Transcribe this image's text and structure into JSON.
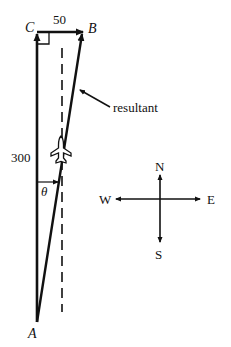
{
  "diagram": {
    "points": {
      "A": {
        "label": "A"
      },
      "B": {
        "label": "B"
      },
      "C": {
        "label": "C"
      }
    },
    "vectors": {
      "north": {
        "label": "300"
      },
      "east": {
        "label": "50"
      },
      "resultant": {
        "label": "resultant"
      }
    },
    "angle": {
      "label": "θ"
    },
    "compass": {
      "N": "N",
      "S": "S",
      "E": "E",
      "W": "W"
    },
    "colors": {
      "stroke": "#111111",
      "background": "#ffffff"
    }
  }
}
